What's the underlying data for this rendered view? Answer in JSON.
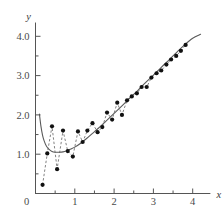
{
  "figure": {
    "top_partial_text": "        ",
    "bottom_partial_text": "            ",
    "colors": {
      "point": "#111111",
      "dashed_line": "#6b6b6b",
      "smooth_curve": "#5a5a5a",
      "axis": "#555555",
      "background": "#ffffff"
    }
  },
  "chart_data": {
    "type": "scatter",
    "title": "",
    "xlabel": "x",
    "ylabel": "y",
    "xlim": [
      0,
      4.45
    ],
    "ylim": [
      0,
      4.35
    ],
    "grid": false,
    "legend": null,
    "xticks": [
      0,
      1,
      2,
      3,
      4
    ],
    "xticklabels": [
      "0",
      "1",
      "2",
      "3",
      "4"
    ],
    "xminorticks": [
      0.5,
      1.5,
      2.5,
      3.5
    ],
    "yticks": [
      1.0,
      2.0,
      3.0,
      4.0
    ],
    "yticklabels": [
      "1.0",
      "2.0",
      "3.0",
      "4.0"
    ],
    "yminorticks": [
      0.5,
      1.5,
      2.5,
      3.5
    ],
    "series": [
      {
        "name": "data points",
        "style": "markers joined by dashed line",
        "marker": "filled circle",
        "x": [
          0.18,
          0.3,
          0.42,
          0.55,
          0.7,
          0.82,
          0.95,
          1.08,
          1.2,
          1.32,
          1.45,
          1.58,
          1.7,
          1.82,
          1.95,
          2.08,
          2.2,
          2.33,
          2.45,
          2.58,
          2.7,
          2.83,
          2.95,
          3.08,
          3.2,
          3.33,
          3.45,
          3.58,
          3.7,
          3.82
        ],
        "y": [
          0.22,
          1.02,
          1.71,
          0.62,
          1.6,
          1.08,
          0.94,
          1.58,
          1.31,
          1.6,
          1.79,
          1.56,
          1.69,
          2.06,
          1.88,
          2.31,
          2.0,
          2.37,
          2.47,
          2.55,
          2.71,
          2.71,
          2.95,
          3.06,
          3.13,
          3.28,
          3.41,
          3.5,
          3.63,
          3.78
        ]
      },
      {
        "name": "fitted curve",
        "style": "smooth solid line",
        "x": [
          0.1,
          0.14,
          0.18,
          0.22,
          0.28,
          0.34,
          0.42,
          0.5,
          0.6,
          0.7,
          0.8,
          0.9,
          1.0,
          1.15,
          1.3,
          1.45,
          1.6,
          1.8,
          2.0,
          2.2,
          2.4,
          2.6,
          2.8,
          3.0,
          3.2,
          3.4,
          3.6,
          3.8,
          4.0,
          4.2
        ],
        "y": [
          2.02,
          1.7,
          1.48,
          1.34,
          1.2,
          1.13,
          1.07,
          1.05,
          1.05,
          1.06,
          1.09,
          1.13,
          1.18,
          1.28,
          1.4,
          1.53,
          1.66,
          1.85,
          2.04,
          2.23,
          2.43,
          2.62,
          2.82,
          3.01,
          3.21,
          3.4,
          3.6,
          3.79,
          3.95,
          4.05
        ]
      }
    ]
  }
}
